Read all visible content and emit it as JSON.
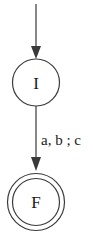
{
  "diagram": {
    "type": "finite-automaton",
    "states": [
      {
        "id": "I",
        "label": "I",
        "initial": true,
        "final": false
      },
      {
        "id": "F",
        "label": "F",
        "initial": false,
        "final": true
      }
    ],
    "transitions": [
      {
        "from": "I",
        "to": "F",
        "label": "a, b ; c"
      }
    ],
    "colors": {
      "stroke": "#3a3a3a",
      "arrow": "#3a3a3a",
      "text": "#1a1a1a",
      "background": "#ffffff"
    }
  }
}
